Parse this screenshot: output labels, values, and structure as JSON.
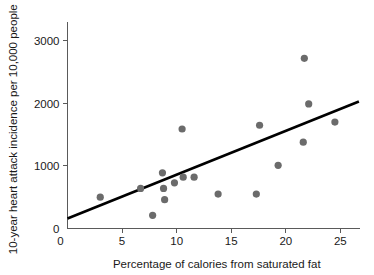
{
  "chart_data": {
    "type": "scatter",
    "title": "",
    "xlabel": "Percentage of calories from saturated fat",
    "ylabel": "10-year heart attack incidence per 10,000 people",
    "xlim": [
      0,
      26.8
    ],
    "ylim": [
      0,
      3300
    ],
    "grid": false,
    "legend": null,
    "xticks": [
      0,
      5,
      10,
      15,
      20,
      25
    ],
    "xtick_labels": [
      "0",
      "5",
      "10",
      "15",
      "20",
      "25"
    ],
    "yticks": [
      0,
      1000,
      2000,
      3000
    ],
    "ytick_labels": [
      "0",
      "1000",
      "2000",
      "3000"
    ],
    "point_color": "#6b6b6b",
    "line_color": "#000000",
    "axis_color": "#5a5a5a",
    "points": [
      {
        "x": 3.0,
        "y": 500
      },
      {
        "x": 6.7,
        "y": 640
      },
      {
        "x": 7.8,
        "y": 210
      },
      {
        "x": 8.7,
        "y": 890
      },
      {
        "x": 8.8,
        "y": 640
      },
      {
        "x": 8.9,
        "y": 460
      },
      {
        "x": 9.8,
        "y": 730
      },
      {
        "x": 10.5,
        "y": 1590
      },
      {
        "x": 10.6,
        "y": 820
      },
      {
        "x": 11.6,
        "y": 820
      },
      {
        "x": 13.8,
        "y": 550
      },
      {
        "x": 17.3,
        "y": 550
      },
      {
        "x": 17.6,
        "y": 1650
      },
      {
        "x": 19.3,
        "y": 1010
      },
      {
        "x": 21.6,
        "y": 1380
      },
      {
        "x": 21.7,
        "y": 2720
      },
      {
        "x": 22.1,
        "y": 1990
      },
      {
        "x": 24.5,
        "y": 1700
      }
    ],
    "trend_line": {
      "x0": 0.0,
      "y0": 160,
      "x1": 26.7,
      "y1": 2030
    }
  }
}
